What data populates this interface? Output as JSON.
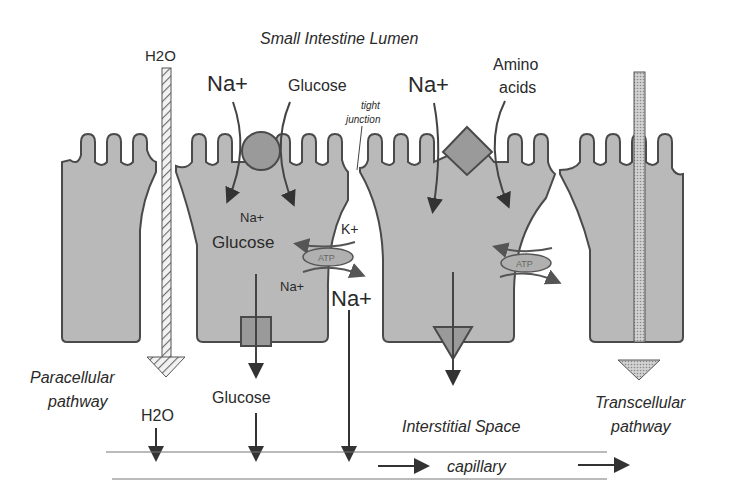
{
  "title": "Small Intestine Lumen",
  "colors": {
    "cell_fill": "#b9b9b9",
    "cell_stroke": "#4a4a4a",
    "transporter_fill": "#8f8f8f",
    "text": "#2a2a2a",
    "background": "#ffffff"
  },
  "labels": {
    "h2o_top": "H2O",
    "na_left": "Na+",
    "glucose_top": "Glucose",
    "tight_junction_1": "tight",
    "tight_junction_2": "junction",
    "na_right": "Na+",
    "amino_1": "Amino",
    "amino_2": "acids",
    "cell_na": "Na+",
    "cell_glucose": "Glucose",
    "k_plus": "K+",
    "atp_left": "ATP",
    "cell_na_bottom": "Na+",
    "na_big": "Na+",
    "atp_right": "ATP",
    "paracellular_1": "Paracellular",
    "paracellular_2": "pathway",
    "glucose_bottom": "Glucose",
    "h2o_bottom": "H2O",
    "interstitial": "Interstitial Space",
    "transcellular_1": "Transcellular",
    "transcellular_2": "pathway",
    "capillary": "capillary"
  }
}
